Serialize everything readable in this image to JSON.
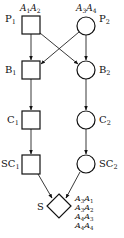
{
  "diagram": {
    "type": "petri-style flow graph",
    "nodes": [
      {
        "id": "P1",
        "label": "P",
        "sub": "1",
        "shape": "square",
        "annotation": [
          {
            "a": "A",
            "s": "1"
          },
          {
            "a": "A",
            "s": "2"
          }
        ]
      },
      {
        "id": "P2",
        "label": "P",
        "sub": "2",
        "shape": "circle",
        "annotation": [
          {
            "a": "A",
            "s": "3"
          },
          {
            "a": "A",
            "s": "4"
          }
        ]
      },
      {
        "id": "B1",
        "label": "B",
        "sub": "1",
        "shape": "square"
      },
      {
        "id": "B2",
        "label": "B",
        "sub": "2",
        "shape": "circle"
      },
      {
        "id": "C1",
        "label": "C",
        "sub": "1",
        "shape": "square"
      },
      {
        "id": "C2",
        "label": "C",
        "sub": "2",
        "shape": "circle"
      },
      {
        "id": "SC1",
        "label": "SC",
        "sub": "1",
        "shape": "square"
      },
      {
        "id": "SC2",
        "label": "SC",
        "sub": "2",
        "shape": "circle"
      },
      {
        "id": "S",
        "label": "S",
        "sub": "",
        "shape": "diamond"
      }
    ],
    "edges": [
      {
        "from": "P1",
        "to": "B1"
      },
      {
        "from": "P1",
        "to": "B2"
      },
      {
        "from": "P2",
        "to": "B1"
      },
      {
        "from": "P2",
        "to": "B2"
      },
      {
        "from": "B1",
        "to": "C1"
      },
      {
        "from": "B2",
        "to": "C2"
      },
      {
        "from": "C1",
        "to": "SC1"
      },
      {
        "from": "C2",
        "to": "SC2"
      },
      {
        "from": "SC1",
        "to": "S"
      },
      {
        "from": "SC2",
        "to": "S"
      }
    ],
    "s_annotation": [
      [
        {
          "a": "A",
          "s": "3"
        },
        {
          "a": "A",
          "s": "1"
        }
      ],
      [
        {
          "a": "A",
          "s": "3"
        },
        {
          "a": "A",
          "s": "2"
        }
      ],
      [
        {
          "a": "A",
          "s": "4"
        },
        {
          "a": "A",
          "s": "3"
        }
      ],
      [
        {
          "a": "A",
          "s": "4"
        },
        {
          "a": "A",
          "s": "4"
        }
      ]
    ]
  }
}
